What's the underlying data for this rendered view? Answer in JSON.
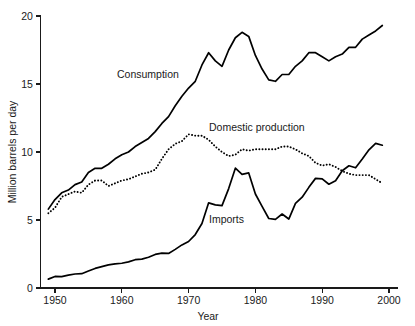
{
  "figure": {
    "title_fragment": "",
    "background_color": "#ffffff",
    "line_color": "#000000"
  },
  "axes": {
    "y_label": "Million barrels per day",
    "x_label": "Year",
    "y_ticks": [
      "0",
      "5",
      "10",
      "15",
      "20"
    ],
    "x_ticks": [
      "1950",
      "1960",
      "1970",
      "1980",
      "1990",
      "2000"
    ]
  },
  "labels": {
    "consumption": "Consumption",
    "domestic_production": "Domestic production",
    "imports": "Imports"
  },
  "chart_data": {
    "type": "line",
    "title": "",
    "xlabel": "Year",
    "ylabel": "Million barrels per day",
    "xlim": [
      1949,
      2000
    ],
    "ylim": [
      0,
      20
    ],
    "y_ticks": [
      0,
      5,
      10,
      15,
      20
    ],
    "x_ticks": [
      1950,
      1960,
      1970,
      1980,
      1990,
      2000
    ],
    "grid": false,
    "legend": "inline-annotations",
    "x": [
      1949,
      1950,
      1951,
      1952,
      1953,
      1954,
      1955,
      1956,
      1957,
      1958,
      1959,
      1960,
      1961,
      1962,
      1963,
      1964,
      1965,
      1966,
      1967,
      1968,
      1969,
      1970,
      1971,
      1972,
      1973,
      1974,
      1975,
      1976,
      1977,
      1978,
      1979,
      1980,
      1981,
      1982,
      1983,
      1984,
      1985,
      1986,
      1987,
      1988,
      1989,
      1990,
      1991,
      1992,
      1993,
      1994,
      1995,
      1996,
      1997,
      1998,
      1999
    ],
    "series": [
      {
        "name": "Consumption",
        "style": "solid",
        "values": [
          5.8,
          6.5,
          7.0,
          7.2,
          7.6,
          7.8,
          8.5,
          8.8,
          8.8,
          9.1,
          9.5,
          9.8,
          10.0,
          10.4,
          10.7,
          11.0,
          11.5,
          12.1,
          12.6,
          13.4,
          14.1,
          14.7,
          15.2,
          16.4,
          17.3,
          16.7,
          16.3,
          17.5,
          18.4,
          18.8,
          18.5,
          17.1,
          16.1,
          15.3,
          15.2,
          15.7,
          15.7,
          16.3,
          16.7,
          17.3,
          17.3,
          17.0,
          16.7,
          17.0,
          17.2,
          17.7,
          17.7,
          18.3,
          18.6,
          18.9,
          19.3
        ]
      },
      {
        "name": "Domestic production",
        "style": "dotted",
        "values": [
          5.5,
          5.9,
          6.7,
          6.9,
          7.1,
          7.0,
          7.6,
          7.9,
          7.9,
          7.5,
          7.7,
          7.9,
          8.0,
          8.2,
          8.4,
          8.5,
          8.7,
          9.5,
          10.2,
          10.6,
          10.8,
          11.3,
          11.2,
          11.2,
          10.9,
          10.4,
          10.0,
          9.7,
          9.8,
          10.2,
          10.1,
          10.2,
          10.2,
          10.2,
          10.2,
          10.4,
          10.4,
          10.2,
          9.9,
          9.7,
          9.2,
          9.0,
          9.1,
          8.9,
          8.6,
          8.4,
          8.3,
          8.3,
          8.3,
          8.0,
          7.7
        ]
      },
      {
        "name": "Imports",
        "style": "solid",
        "values": [
          0.65,
          0.85,
          0.84,
          0.95,
          1.03,
          1.05,
          1.25,
          1.44,
          1.57,
          1.7,
          1.78,
          1.82,
          1.92,
          2.08,
          2.12,
          2.26,
          2.47,
          2.57,
          2.54,
          2.84,
          3.17,
          3.42,
          3.93,
          4.74,
          6.26,
          6.11,
          6.06,
          7.31,
          8.81,
          8.36,
          8.46,
          6.91,
          6.0,
          5.11,
          5.05,
          5.44,
          5.07,
          6.22,
          6.68,
          7.4,
          8.06,
          8.02,
          7.63,
          7.89,
          8.62,
          8.99,
          8.84,
          9.48,
          10.16,
          10.63,
          10.5
        ]
      }
    ]
  }
}
